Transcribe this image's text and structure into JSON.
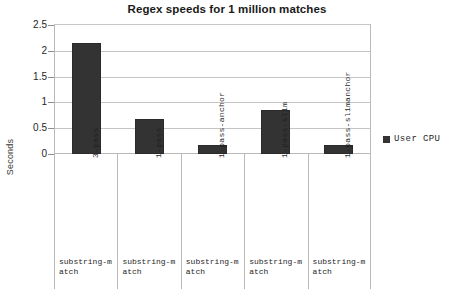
{
  "chart_data": {
    "type": "bar",
    "title": "Regex speeds for 1 million matches",
    "xlabel": "",
    "ylabel": "Seconds",
    "ylim": [
      0,
      2.5
    ],
    "yticks": [
      "0",
      "0.5",
      "1",
      "1.5",
      "2",
      "2.5"
    ],
    "ytick_values": [
      0,
      0.5,
      1,
      1.5,
      2,
      2.5
    ],
    "grid": true,
    "legend_position": "right",
    "series": [
      {
        "name": "User CPU",
        "color": "#333333",
        "values": [
          2.15,
          0.68,
          0.18,
          0.85,
          0.18
        ]
      }
    ],
    "categories": [
      "substring-match",
      "substring-match",
      "substring-match",
      "substring-match",
      "substring-match"
    ],
    "subcategories": [
      "3-pass",
      "1-pass",
      "1-pass-anchor",
      "1-pass-slim",
      "1-pass-slimanchor"
    ]
  },
  "legend": {
    "entries": [
      {
        "label": "User CPU",
        "color": "#333333"
      }
    ]
  },
  "colors": {
    "bar": "#333333",
    "grid": "#c4c4c4",
    "frame": "#b9b9b9",
    "text": "#1f1f1f",
    "background": "#ffffff"
  }
}
